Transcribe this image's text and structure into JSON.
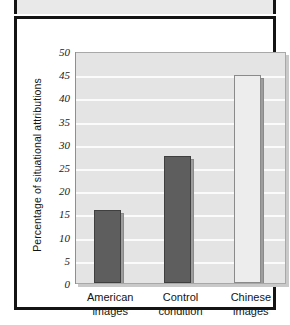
{
  "chart_data": {
    "type": "bar",
    "title": "",
    "subtitle": "",
    "xlabel": "",
    "ylabel": "Percentage of situational attributions",
    "categories": [
      "American images",
      "Control condition",
      "Chinese images"
    ],
    "category_lines": [
      [
        "American",
        "images"
      ],
      [
        "Control",
        "condition"
      ],
      [
        "Chinese",
        "images"
      ]
    ],
    "values": [
      15.8,
      27.3,
      44.8
    ],
    "ylim": [
      0,
      50
    ],
    "ytick_step": 5,
    "yticks": [
      0,
      5,
      10,
      15,
      20,
      25,
      30,
      35,
      40,
      45,
      50
    ],
    "ytick_labels": [
      "0",
      "5",
      "10",
      "15",
      "20",
      "25",
      "30",
      "35",
      "40",
      "45",
      "50"
    ],
    "grid": true,
    "grid_axis": "y",
    "legend": "none",
    "bar_style": "3d-block",
    "bar_colors": [
      "#5e5e5e",
      "#5e5e5e",
      "#ededed"
    ],
    "bar_side_color": "#9d9d9d",
    "bar_border_colors": [
      "#3f3f3f",
      "#3f3f3f",
      "#8a8a8a"
    ],
    "plot_background": "#e4e4e4",
    "gridline_color": "#fbfbfb",
    "frame_color": "#141414",
    "page_background": "#ffffff"
  }
}
